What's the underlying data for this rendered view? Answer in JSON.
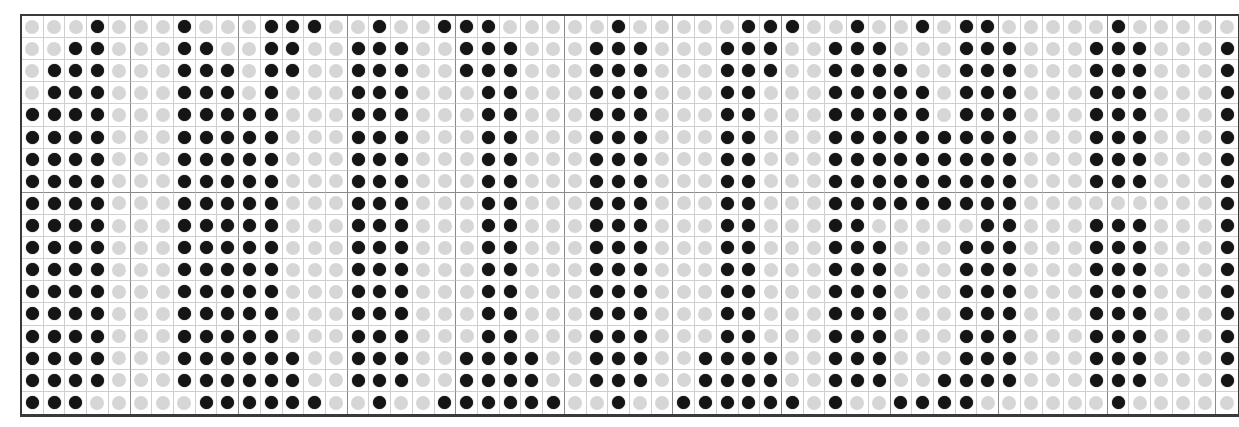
{
  "grid": {
    "columns": 56,
    "rows": 18,
    "colors": {
      "filled_dot": "#151515",
      "empty_dot": "#d6d6d6",
      "minor_line": "#cfcfcf",
      "major_line": "#8a8a8a",
      "border": "#3a3a3a"
    },
    "major_line_every_n_columns": 5,
    "major_line_after_row": 8,
    "pattern": [
      "00010001000111001001110000010000011100100101100000100000",
      "00110001100110011100111000111000111001110001110001110001",
      "01110001110110011100111000111000111001111001110001110001",
      "01110001110100011100011000111000110001111101110001110001",
      "11110001111100011100011000111000110001111101110001110001",
      "11110001111100011100011000111000110001111111110001110001",
      "11110001111100011100011000111000110001111111110001110001",
      "11110001111100011100011000111000110001111111110001110001",
      "11110001111100011100011000111000110001111111110000000001",
      "11110001111100011100011000111000110001100000110001110001",
      "11110001111100011100011000111000110001110001110001110001",
      "11110001111100011100011000111000110001110001110001110001",
      "11110001111100011100011000111000110001110001110001110001",
      "11110001111100011100011000111000110001110001110001110001",
      "11110001111100011100011000111000110001110001110001110001",
      "11110001111110011100111100111001111001110001110001110001",
      "11110001111110011100111100111001111001110011110001110001",
      "11100000111111001001111110010011111101001111000000100000"
    ]
  }
}
